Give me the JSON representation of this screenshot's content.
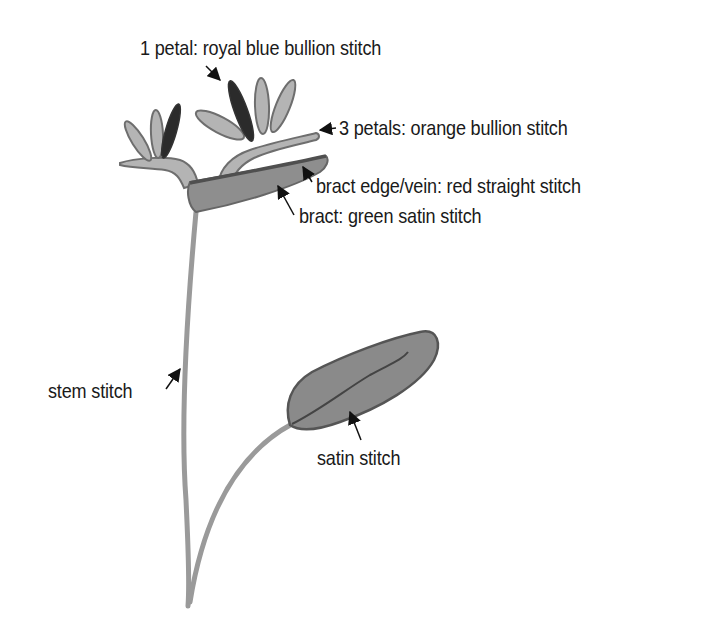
{
  "diagram": {
    "colors": {
      "background": "#ffffff",
      "stem": "#9a9a9a",
      "petal_light": "#b4b4b4",
      "petal_dark": "#2b2b2b",
      "outline": "#6e6e6e",
      "bract_fill": "#8e8e8e",
      "bract_edge": "#4f4f4f",
      "leaf_fill": "#8a8a8a",
      "leaf_edge": "#555555",
      "text": "#1a1a1a",
      "arrow": "#111111"
    },
    "labels": [
      {
        "id": "royal-blue-petal",
        "text": "1 petal: royal blue bullion stitch"
      },
      {
        "id": "orange-petals",
        "text": "3 petals: orange bullion stitch"
      },
      {
        "id": "bract-edge",
        "text": "bract edge/vein: red straight stitch"
      },
      {
        "id": "bract",
        "text": "bract: green satin stitch"
      },
      {
        "id": "stem",
        "text": "stem stitch"
      },
      {
        "id": "leaf",
        "text": "satin stitch"
      }
    ]
  }
}
